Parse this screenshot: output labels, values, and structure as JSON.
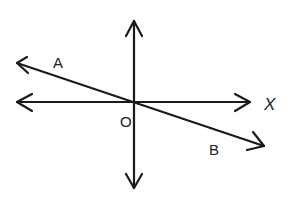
{
  "diagram": {
    "labels": {
      "a": "A",
      "b": "B",
      "o": "O",
      "x": "X"
    },
    "colors": {
      "stroke": "#1a1a1a",
      "background": "#ffffff"
    }
  }
}
